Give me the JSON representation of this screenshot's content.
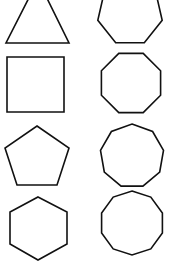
{
  "diagram": {
    "title": "",
    "background": "#ffffff",
    "stroke_color": "#111111",
    "shapes": [
      {
        "name": "triangle",
        "sides": 3,
        "column": 0,
        "row": 0,
        "points": "38,-20 69,43 6,43"
      },
      {
        "name": "square",
        "sides": 4,
        "column": 0,
        "row": 1,
        "points": "7,57 64,57 64,112 7,112"
      },
      {
        "name": "pentagon",
        "sides": 5,
        "column": 0,
        "row": 2,
        "points": "37,126 69,148 57,185 17,185 5,148"
      },
      {
        "name": "hexagon",
        "sides": 6,
        "column": 0,
        "row": 3,
        "points": "38,197 67,212 67,244 38,260 10,244 10,212"
      },
      {
        "name": "heptagon",
        "sides": 7,
        "column": 1,
        "row": 0,
        "cx": 130,
        "cy": 13,
        "r": 33,
        "rotation_deg": 0
      },
      {
        "name": "octagon",
        "sides": 8,
        "column": 1,
        "row": 1,
        "cx": 131,
        "cy": 83,
        "r": 32,
        "rotation_deg": 22.5
      },
      {
        "name": "nonagon",
        "sides": 9,
        "column": 1,
        "row": 2,
        "cx": 132,
        "cy": 156,
        "r": 32,
        "rotation_deg": 0
      },
      {
        "name": "decagon",
        "sides": 10,
        "column": 1,
        "row": 3,
        "cx": 132,
        "cy": 223,
        "r": 32,
        "rotation_deg": 0
      }
    ]
  }
}
